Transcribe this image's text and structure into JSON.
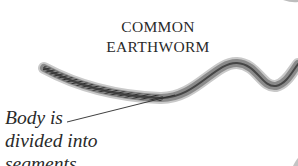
{
  "title": {
    "line1": "COMMON",
    "line2": "EARTHWORM"
  },
  "annotation": {
    "line1": "Body is",
    "line2": "divided into",
    "line3": "segments"
  },
  "colors": {
    "text": "#2a2a2a",
    "worm_dark": "#3a3a3a",
    "worm_mid": "#7a7a7a",
    "worm_light": "#b5b5b5",
    "background": "#ffffff"
  }
}
